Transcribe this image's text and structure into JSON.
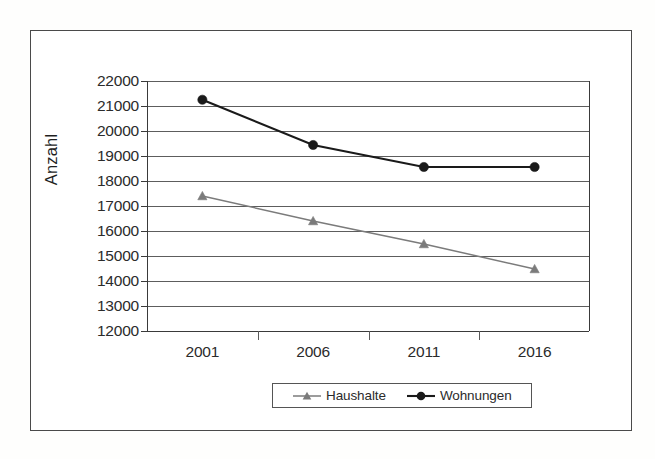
{
  "chart_data": {
    "type": "line",
    "title": "",
    "subtitle": "",
    "xlabel": "",
    "ylabel": "Anzahl",
    "categories": [
      "2001",
      "2006",
      "2011",
      "2016"
    ],
    "ylim": [
      12000,
      22000
    ],
    "ytick_step": 1000,
    "yticks": [
      "22000",
      "21000",
      "20000",
      "19000",
      "18000",
      "17000",
      "16000",
      "15000",
      "14000",
      "13000",
      "12000"
    ],
    "grid": true,
    "legend_position": "bottom-center",
    "series": [
      {
        "name": "Haushalte",
        "marker": "triangle",
        "color": "#7b7b7b",
        "values": [
          17400,
          16400,
          15480,
          14480
        ]
      },
      {
        "name": "Wohnungen",
        "marker": "circle",
        "color": "#1a1a1a",
        "values": [
          21250,
          19440,
          18560,
          18560
        ]
      }
    ]
  },
  "legend": {
    "entries": [
      {
        "label": "Haushalte",
        "marker": "triangle-marker-icon"
      },
      {
        "label": "Wohnungen",
        "marker": "circle-marker-icon"
      }
    ]
  },
  "colors": {
    "frame": "#4a4a4a",
    "grid": "#5d5d5d",
    "axis": "#3a3a3a",
    "haushalte": "#7b7b7b",
    "wohnungen": "#1a1a1a",
    "text": "#2b2b2b"
  }
}
